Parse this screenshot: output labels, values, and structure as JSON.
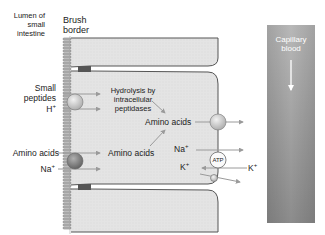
{
  "diagram": {
    "regions": {
      "lumen": "Lumen of small intestine",
      "lumen_lines": [
        "Lumen of",
        "small",
        "intestine"
      ],
      "brush_border_lines": [
        "Brush",
        "border"
      ],
      "capillary_lines": [
        "Capillary",
        "blood"
      ]
    },
    "left_labels": {
      "small_peptides_lines": [
        "Small",
        "peptides"
      ],
      "h_ion": "H",
      "h_charge": "+",
      "amino_acids": "Amino acids",
      "na_ion": "Na",
      "na_charge": "+"
    },
    "cell_labels": {
      "hydrolysis_lines": [
        "Hydrolysis by",
        "intracellular",
        "peptidases"
      ],
      "amino_acids_upper": "Amino acids",
      "amino_acids_lower": "Amino acids",
      "na_ion": "Na",
      "na_charge": "+",
      "k_ion": "K",
      "k_charge": "+",
      "atp": "ATP"
    },
    "right_labels": {
      "k_ion": "K",
      "k_charge": "+"
    },
    "colors": {
      "cell_fill": "#e6e6e6",
      "cell_outline": "#555555",
      "arrow": "#999999",
      "tight_junction": "#555555",
      "capillary_top": "#b5b5b5",
      "capillary_bottom": "#8e8e8e",
      "transporter_light": "#d8d8d8",
      "transporter_dark": "#8a8a8a"
    }
  }
}
